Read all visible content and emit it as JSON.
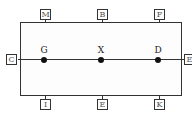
{
  "diagram": {
    "type": "schematic-block",
    "frame_color": "#333333",
    "top_ports": [
      {
        "label": "M"
      },
      {
        "label": "B"
      },
      {
        "label": "F"
      }
    ],
    "bottom_ports": [
      {
        "label": "I"
      },
      {
        "label": "E"
      },
      {
        "label": "K"
      }
    ],
    "left_port": {
      "label": "C"
    },
    "right_port": {
      "label": "E"
    },
    "nodes": [
      {
        "label": "G"
      },
      {
        "label": "X"
      },
      {
        "label": "D"
      }
    ]
  }
}
